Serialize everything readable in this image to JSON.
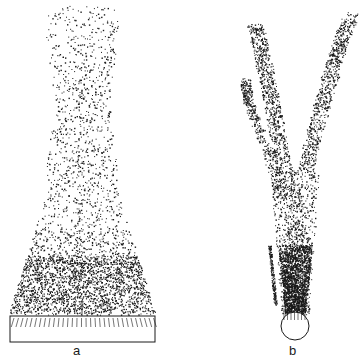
{
  "figure": {
    "panels": [
      {
        "id": "a",
        "label": "a",
        "description": "particle cloud rising from a wide rectangular base, forming a tapering plume"
      },
      {
        "id": "b",
        "label": "b",
        "description": "particle cloud rising from a small circular base, forming a branching, tilted plume"
      }
    ],
    "colors": {
      "ink": "#1a1a1a",
      "background": "#ffffff"
    }
  }
}
